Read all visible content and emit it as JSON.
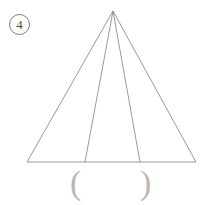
{
  "page": {
    "background_color": "#ffffff",
    "width": 208,
    "height": 205
  },
  "problem": {
    "number_label": "4",
    "number_marker_shape": "circled",
    "marker_color": "#7a7a7a"
  },
  "figure": {
    "name": "triangle-with-two-cevians",
    "stroke_color": "#808080",
    "stroke_width": 0.8,
    "apex": {
      "x": 113,
      "y": 11
    },
    "base_left": {
      "x": 27,
      "y": 162
    },
    "base_right": {
      "x": 196,
      "y": 162
    },
    "cevian_feet": [
      {
        "x": 85,
        "y": 162
      },
      {
        "x": 140,
        "y": 162
      }
    ],
    "segments": [
      {
        "name": "left-side",
        "x1": 113,
        "y1": 11,
        "x2": 27,
        "y2": 162
      },
      {
        "name": "right-side",
        "x1": 113,
        "y1": 11,
        "x2": 196,
        "y2": 162
      },
      {
        "name": "base",
        "x1": 27,
        "y1": 162,
        "x2": 196,
        "y2": 162
      },
      {
        "name": "cevian-left",
        "x1": 113,
        "y1": 11,
        "x2": 85,
        "y2": 162
      },
      {
        "name": "cevian-right",
        "x1": 113,
        "y1": 11,
        "x2": 140,
        "y2": 162
      }
    ],
    "triangle_count_regions": 4
  },
  "answer_blank": {
    "open_paren": "(",
    "close_paren": ")",
    "value": "",
    "color": "#b8b8b8"
  }
}
